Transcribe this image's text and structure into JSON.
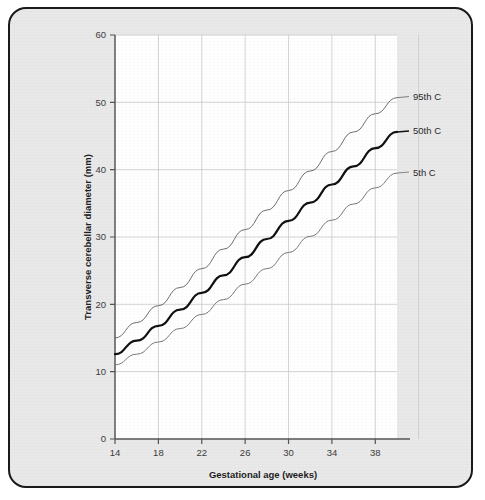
{
  "figure": {
    "background_color": "#e9e9e9",
    "plot_background_color": "#ffffff",
    "border_color": "#1a1a1a"
  },
  "chart_data": {
    "type": "line",
    "title": "",
    "subtitle": "",
    "xlabel": "Gestational age (weeks)",
    "ylabel": "Transverse cerebellar diameter (mm)",
    "xlim": [
      14,
      40
    ],
    "ylim": [
      0,
      60
    ],
    "xticks": [
      14,
      18,
      22,
      26,
      30,
      34,
      38
    ],
    "yticks": [
      0,
      10,
      20,
      30,
      40,
      50,
      60
    ],
    "xtick_labels": [
      "14",
      "18",
      "22",
      "26",
      "30",
      "34",
      "38"
    ],
    "ytick_labels": [
      "0",
      "10",
      "20",
      "30",
      "40",
      "50",
      "60"
    ],
    "grid": true,
    "grid_color": "#c9c9c9",
    "legend_position": "right-inline-annotations",
    "x": [
      14,
      16,
      18,
      20,
      22,
      24,
      26,
      28,
      30,
      32,
      34,
      36,
      38,
      40
    ],
    "series": [
      {
        "name": "95th C",
        "label": "95th C",
        "color": "#6e6e6e",
        "linewidth": 1,
        "values": [
          15.0,
          17.3,
          19.8,
          22.5,
          25.3,
          28.2,
          31.1,
          34.0,
          36.9,
          39.8,
          42.7,
          45.6,
          48.3,
          50.7
        ]
      },
      {
        "name": "50th C",
        "label": "50th C",
        "color": "#111111",
        "linewidth": 2.2,
        "values": [
          12.6,
          14.6,
          16.8,
          19.2,
          21.7,
          24.3,
          27.0,
          29.7,
          32.4,
          35.1,
          37.8,
          40.5,
          43.2,
          45.6
        ]
      },
      {
        "name": "5th C",
        "label": "5th C",
        "color": "#7a7a7a",
        "linewidth": 1,
        "values": [
          11.0,
          12.6,
          14.4,
          16.4,
          18.5,
          20.7,
          23.0,
          25.3,
          27.7,
          30.1,
          32.5,
          34.9,
          37.3,
          39.5
        ]
      }
    ]
  }
}
